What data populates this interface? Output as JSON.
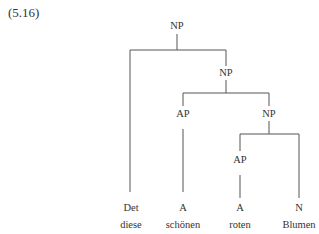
{
  "example_number": "(5.16)",
  "tree": {
    "nodes": [
      {
        "id": "np_root",
        "label": "NP",
        "x": 177,
        "y": 29
      },
      {
        "id": "np_2",
        "label": "NP",
        "x": 226,
        "y": 76
      },
      {
        "id": "ap_1",
        "label": "AP",
        "x": 183,
        "y": 117
      },
      {
        "id": "np_3",
        "label": "NP",
        "x": 269,
        "y": 117
      },
      {
        "id": "ap_2",
        "label": "AP",
        "x": 240,
        "y": 163
      },
      {
        "id": "det",
        "label": "Det",
        "x": 131,
        "y": 211
      },
      {
        "id": "a_1",
        "label": "A",
        "x": 183,
        "y": 211
      },
      {
        "id": "a_2",
        "label": "A",
        "x": 240,
        "y": 211
      },
      {
        "id": "n",
        "label": "N",
        "x": 299,
        "y": 211
      }
    ],
    "words": [
      {
        "label": "diese",
        "x": 131,
        "y": 228
      },
      {
        "label": "schönen",
        "x": 183,
        "y": 228
      },
      {
        "label": "roten",
        "x": 240,
        "y": 228
      },
      {
        "label": "Blumen",
        "x": 299,
        "y": 228
      }
    ]
  }
}
